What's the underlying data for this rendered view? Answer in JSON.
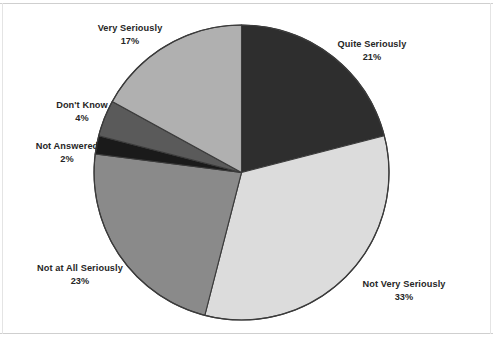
{
  "chart_data": {
    "type": "pie",
    "title": "",
    "subtitle": "",
    "xlabel": "",
    "ylabel": "",
    "legend_position": "none",
    "grid": false,
    "start_angle_deg": 0,
    "direction": "clockwise",
    "categories": [
      "Quite Seriously",
      "Not Very Seriously",
      "Not at All Seriously",
      "Not Answered",
      "Don't Know",
      "Very Seriously"
    ],
    "values": [
      21,
      33,
      23,
      2,
      4,
      17
    ],
    "value_unit": "%",
    "slices": [
      {
        "label": "Quite Seriously",
        "value": 21,
        "value_text": "21%",
        "color": "#2e2e2e"
      },
      {
        "label": "Not Very Seriously",
        "value": 33,
        "value_text": "33%",
        "color": "#dcdcdc"
      },
      {
        "label": "Not at All Seriously",
        "value": 23,
        "value_text": "23%",
        "color": "#8a8a8a"
      },
      {
        "label": "Not Answered",
        "value": 2,
        "value_text": "2%",
        "color": "#1a1a1a"
      },
      {
        "label": "Don't Know",
        "value": 4,
        "value_text": "4%",
        "color": "#5a5a5a"
      },
      {
        "label": "Very Seriously",
        "value": 17,
        "value_text": "17%",
        "color": "#b0b0b0"
      }
    ]
  },
  "labels": {
    "very_seriously": {
      "name": "Very Seriously",
      "pct": "17%"
    },
    "quite_seriously": {
      "name": "Quite Seriously",
      "pct": "21%"
    },
    "dont_know": {
      "name": "Don't Know",
      "pct": "4%"
    },
    "not_answered": {
      "name": "Not Answered",
      "pct": "2%"
    },
    "not_at_all_seriously": {
      "name": "Not at All Seriously",
      "pct": "23%"
    },
    "not_very_seriously": {
      "name": "Not Very Seriously",
      "pct": "33%"
    }
  },
  "style": {
    "background": "#ffffff",
    "slice_outline": "#3b3b3b",
    "text_color": "#262626",
    "frame_line": "#cfcfcf"
  }
}
